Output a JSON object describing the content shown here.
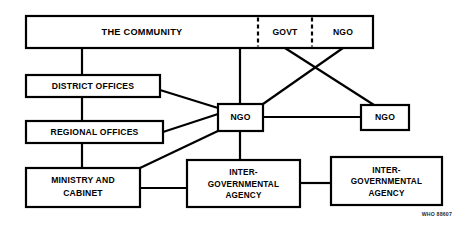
{
  "diagram": {
    "background_color": "#ffffff",
    "line_color": "#000000",
    "caption": "WHO 88607",
    "nodes": {
      "community": {
        "label": "THE COMMUNITY"
      },
      "govt": {
        "label": "GOVT"
      },
      "ngo_top": {
        "label": "NGO"
      },
      "district_offices": {
        "label": "DISTRICT OFFICES"
      },
      "regional_offices": {
        "label": "REGIONAL OFFICES"
      },
      "ngo_center": {
        "label": "NGO"
      },
      "ngo_right": {
        "label": "NGO"
      },
      "ministry": {
        "label_line1": "MINISTRY AND",
        "label_line2": "CABINET"
      },
      "agency_middle": {
        "label_line1": "INTER-",
        "label_line2": "GOVERNMENTAL",
        "label_line3": "AGENCY"
      },
      "agency_right": {
        "label_line1": "INTER-",
        "label_line2": "GOVERNMENTAL",
        "label_line3": "AGENCY"
      }
    }
  }
}
